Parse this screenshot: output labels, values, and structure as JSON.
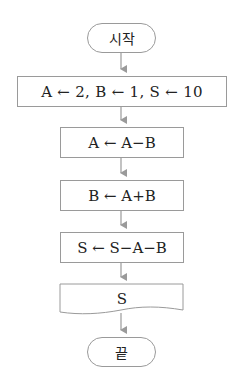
{
  "flowchart": {
    "start": {
      "label": "시작"
    },
    "steps": [
      {
        "type": "process",
        "label": "A ← 2, B ← 1, S ← 10"
      },
      {
        "type": "process",
        "label": "A ← A−B"
      },
      {
        "type": "process",
        "label": "B ← A+B"
      },
      {
        "type": "process",
        "label": "S ← S−A−B"
      },
      {
        "type": "output",
        "label": "S"
      }
    ],
    "end": {
      "label": "끝"
    }
  },
  "colors": {
    "stroke": "#9a9a9a",
    "arrow": "#9a9a9a",
    "text": "#222222",
    "background": "#ffffff"
  }
}
